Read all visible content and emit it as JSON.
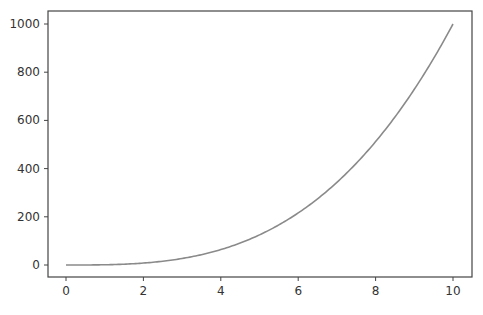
{
  "chart_data": {
    "type": "line",
    "title": "",
    "xlabel": "",
    "ylabel": "",
    "xlim": [
      -0.5,
      10.5
    ],
    "ylim": [
      -50,
      1050
    ],
    "grid": false,
    "legend": null,
    "x_ticks": [
      0,
      2,
      4,
      6,
      8,
      10
    ],
    "x_tick_labels": [
      "0",
      "2",
      "4",
      "6",
      "8",
      "10"
    ],
    "y_ticks": [
      0,
      200,
      400,
      600,
      800,
      1000
    ],
    "y_tick_labels": [
      "0",
      "200",
      "400",
      "600",
      "800",
      "1000"
    ],
    "series": [
      {
        "name": "y = x^3",
        "color": "#8a8a8a",
        "x": [
          0,
          0.5,
          1,
          1.5,
          2,
          2.5,
          3,
          3.5,
          4,
          4.5,
          5,
          5.5,
          6,
          6.5,
          7,
          7.5,
          8,
          8.5,
          9,
          9.5,
          10
        ],
        "values": [
          0,
          0.125,
          1,
          3.375,
          8,
          15.625,
          27,
          42.875,
          64,
          91.125,
          125,
          166.375,
          216,
          274.625,
          343,
          421.875,
          512,
          614.125,
          729,
          857.375,
          1000
        ]
      }
    ]
  },
  "layout": {
    "plot_left": 48,
    "plot_top": 11,
    "plot_right": 472,
    "plot_bottom": 277,
    "x0_px": 66,
    "x10_px": 453,
    "y0_px": 265,
    "y1000_px": 24,
    "axis_color": "#444444"
  }
}
